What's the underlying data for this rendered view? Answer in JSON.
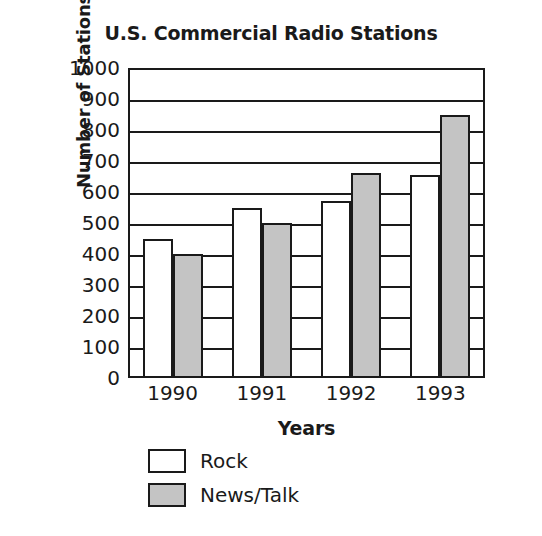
{
  "chart_data": {
    "type": "bar",
    "title": "U.S. Commercial Radio Stations",
    "xlabel": "Years",
    "ylabel": "Number of Stations",
    "categories": [
      "1990",
      "1991",
      "1992",
      "1993"
    ],
    "series": [
      {
        "name": "Rock",
        "values": [
          450,
          550,
          570,
          655
        ],
        "color": "#ffffff"
      },
      {
        "name": "News/Talk",
        "values": [
          400,
          500,
          660,
          850
        ],
        "color": "#c4c4c4"
      }
    ],
    "ylim": [
      0,
      1000
    ],
    "ytick_values": [
      1000,
      900,
      800,
      700,
      600,
      500,
      400,
      300,
      200,
      100,
      0
    ],
    "ytick_labels": [
      "1000",
      "900",
      "800",
      "700",
      "600",
      "500",
      "400",
      "300",
      "200",
      "100",
      "0"
    ],
    "grid": "horizontal",
    "legend_position": "below-axis-left",
    "legend_entries": [
      "Rock",
      "News/Talk"
    ],
    "axis_color": "#1a1a1a",
    "background": "#ffffff"
  }
}
